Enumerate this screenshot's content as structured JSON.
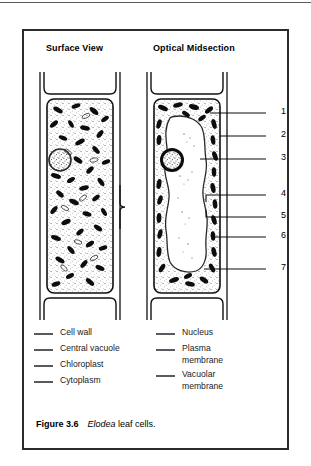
{
  "figure": {
    "caption_number": "Figure 3.6",
    "caption_genus": "Elodea",
    "caption_rest": " leaf cells."
  },
  "panels": [
    {
      "id": "surface-view",
      "title": "Surface View"
    },
    {
      "id": "optical-midsection",
      "title": "Optical Midsection"
    }
  ],
  "callouts": [
    {
      "number": "1",
      "y": 110
    },
    {
      "number": "2",
      "y": 133
    },
    {
      "number": "3",
      "y": 156
    },
    {
      "number": "4",
      "y": 192
    },
    {
      "number": "5",
      "y": 214
    },
    {
      "number": "6",
      "y": 234
    },
    {
      "number": "7",
      "y": 266
    }
  ],
  "legend": {
    "left_column": [
      {
        "label": "Cell wall"
      },
      {
        "label": "Central vacuole"
      },
      {
        "label": "Chloroplast"
      },
      {
        "label": "Cytoplasm"
      }
    ],
    "right_column": [
      {
        "label": "Nucleus"
      },
      {
        "label": "Plasma\nmembrane"
      },
      {
        "label": "Vacuolar\nmembrane"
      }
    ]
  },
  "colors": {
    "ink": "#000000",
    "frame": "#2b2b2b",
    "rule": "#5a5a5a",
    "legend_dash": "#555b60",
    "background": "#ffffff"
  }
}
